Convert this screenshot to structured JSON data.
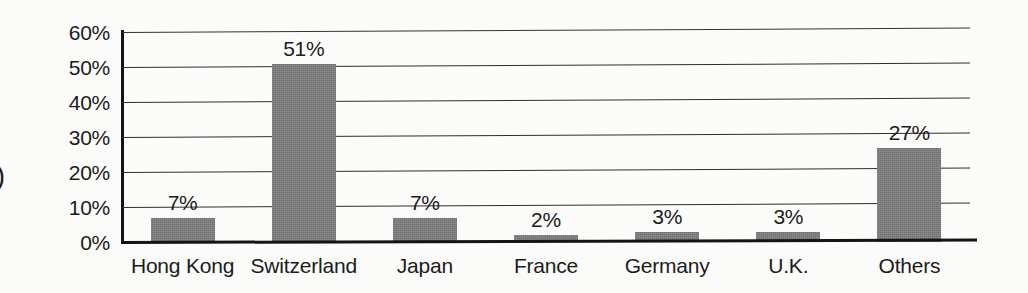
{
  "chart_data": {
    "type": "bar",
    "title": "",
    "subtitle": "",
    "xlabel": "",
    "ylabel": "",
    "categories": [
      "Hong Kong",
      "Switzerland",
      "Japan",
      "France",
      "Germany",
      "U.K.",
      "Others"
    ],
    "values": [
      7,
      51,
      7,
      2,
      3,
      3,
      27
    ],
    "data_labels": [
      "7%",
      "51%",
      "7%",
      "2%",
      "3%",
      "3%",
      "27%"
    ],
    "ylim": [
      0,
      60
    ],
    "ytick_labels": [
      "60%",
      "50%",
      "40%",
      "30%",
      "20%",
      "10%",
      "0%"
    ],
    "ytick_values": [
      60,
      50,
      40,
      30,
      20,
      10,
      0
    ],
    "grid": true,
    "legend": "none",
    "bar_color": "#7e7e7e",
    "axis_color": "#141414",
    "gridline_color": "#2e2e2e",
    "background_color": "#fbfbfa",
    "text_color": "#1b1b1b"
  },
  "artifacts": {
    "left_edge_glyph": ")"
  }
}
